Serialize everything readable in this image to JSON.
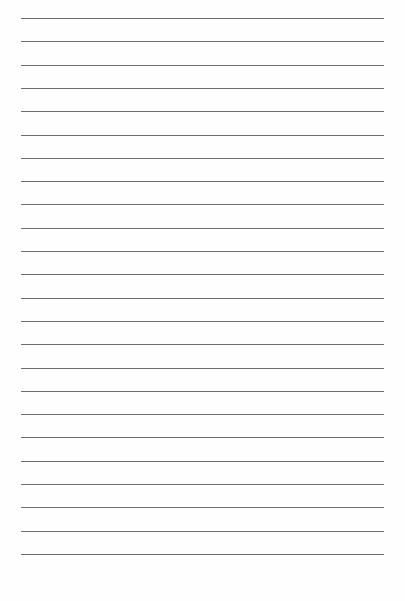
{
  "page": {
    "type": "lined-paper",
    "line_count": 24,
    "line_color": "#6e6e6e",
    "background_color": "#fefefe"
  }
}
